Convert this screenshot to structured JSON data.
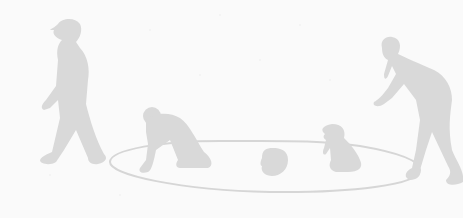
{
  "scene": {
    "description": "Faded grey silhouette illustration of children playing around a drawn circle on the ground",
    "colors": {
      "background": "#fafafa",
      "silhouette": "#d9d9d9",
      "circle_line": "#d6d6d6"
    },
    "figures": [
      {
        "name": "walking-child",
        "pose": "walking"
      },
      {
        "name": "crawling-child",
        "pose": "crawling on hands and knees"
      },
      {
        "name": "head-in-circle",
        "pose": "head only visible"
      },
      {
        "name": "kneeling-child",
        "pose": "kneeling"
      },
      {
        "name": "bending-adult",
        "pose": "bending forward reaching"
      }
    ]
  }
}
